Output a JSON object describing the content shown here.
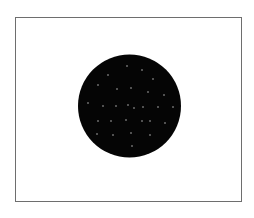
{
  "figure": {
    "background": "#ffffff",
    "frame": {
      "x": 15,
      "y": 17,
      "width": 226,
      "height": 184,
      "border_color": "#6e6e6e"
    },
    "disc": {
      "shape": "circle",
      "cx": 129.5,
      "cy": 106,
      "r": 51.5,
      "fill": "#050505"
    },
    "dots": {
      "color": "#d8d8d8",
      "radius": 0.7,
      "points": [
        [
          127,
          66
        ],
        [
          142,
          70
        ],
        [
          108,
          75
        ],
        [
          153,
          79
        ],
        [
          98,
          85
        ],
        [
          117,
          89
        ],
        [
          131,
          88
        ],
        [
          148,
          92
        ],
        [
          164,
          95
        ],
        [
          88,
          103
        ],
        [
          103,
          106
        ],
        [
          116,
          106
        ],
        [
          128,
          105
        ],
        [
          134,
          108
        ],
        [
          143,
          107
        ],
        [
          158,
          107
        ],
        [
          173,
          107
        ],
        [
          98,
          121
        ],
        [
          111,
          121
        ],
        [
          126,
          120
        ],
        [
          142,
          121
        ],
        [
          150,
          121
        ],
        [
          165,
          123
        ],
        [
          97,
          134
        ],
        [
          113,
          135
        ],
        [
          131,
          133
        ],
        [
          150,
          135
        ],
        [
          132,
          146
        ]
      ]
    }
  }
}
